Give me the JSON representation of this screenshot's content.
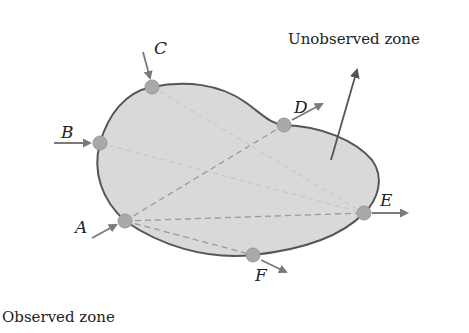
{
  "diagram": {
    "labels": {
      "unobserved_zone": "Unobserved zone",
      "observed_zone": "Observed zone"
    },
    "points": [
      {
        "id": "A",
        "label": "A",
        "direction": "inward"
      },
      {
        "id": "B",
        "label": "B",
        "direction": "inward"
      },
      {
        "id": "C",
        "label": "C",
        "direction": "inward"
      },
      {
        "id": "D",
        "label": "D",
        "direction": "outward"
      },
      {
        "id": "E",
        "label": "E",
        "direction": "outward"
      },
      {
        "id": "F",
        "label": "F",
        "direction": "outward"
      }
    ],
    "connections": [
      {
        "from": "A",
        "to": "D",
        "style": "dashed"
      },
      {
        "from": "A",
        "to": "E",
        "style": "dashed"
      },
      {
        "from": "A",
        "to": "F",
        "style": "dashed"
      },
      {
        "from": "B",
        "to": "E",
        "style": "faint-dashed"
      },
      {
        "from": "C",
        "to": "E",
        "style": "faint-dashed"
      }
    ],
    "colors": {
      "region_fill": "#d9d9d9",
      "outline": "#555555",
      "point_fill": "#a9a9a9",
      "arrow": "#7a7a7a"
    }
  }
}
